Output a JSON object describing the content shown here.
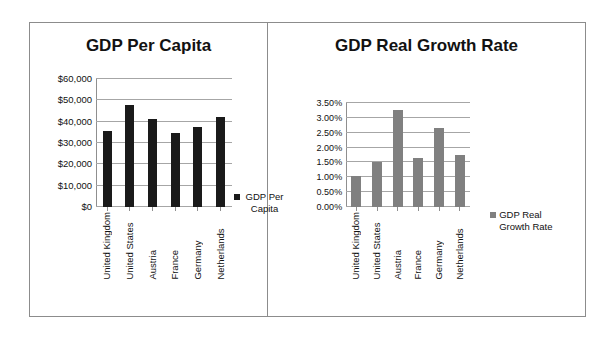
{
  "panels": [
    {
      "title": "GDP Per Capita",
      "legend_label": "GDP Per Capita",
      "legend_color": "#1a1a1a"
    },
    {
      "title": "GDP Real Growth Rate",
      "legend_label": "GDP Real Growth Rate",
      "legend_color": "#808080"
    }
  ],
  "chart_data": [
    {
      "type": "bar",
      "title": "GDP Per Capita",
      "xlabel": "",
      "ylabel": "",
      "categories": [
        "United Kingdom",
        "United States",
        "Austria",
        "France",
        "Germany",
        "Netherlands"
      ],
      "series": [
        {
          "name": "GDP Per Capita",
          "color": "#1a1a1a",
          "values": [
            35700,
            48000,
            41400,
            34800,
            37500,
            42000
          ]
        }
      ],
      "ylim": [
        0,
        60000
      ],
      "ytick_values": [
        0,
        10000,
        20000,
        30000,
        40000,
        50000,
        60000
      ],
      "ytick_labels": [
        "$0",
        "$10,000",
        "$20,000",
        "$30,000",
        "$40,000",
        "$50,000",
        "$60,000"
      ],
      "grid": true,
      "legend_position": "right"
    },
    {
      "type": "bar",
      "title": "GDP Real Growth Rate",
      "xlabel": "",
      "ylabel": "",
      "categories": [
        "United Kingdom",
        "United States",
        "Austria",
        "France",
        "Germany",
        "Netherlands"
      ],
      "series": [
        {
          "name": "GDP Real Growth Rate",
          "color": "#808080",
          "values": [
            1.05,
            1.5,
            3.25,
            1.65,
            2.65,
            1.75
          ]
        }
      ],
      "ylim": [
        0,
        3.5
      ],
      "ytick_values": [
        0,
        0.5,
        1.0,
        1.5,
        2.0,
        2.5,
        3.0,
        3.5
      ],
      "ytick_labels": [
        "0.00%",
        "0.50%",
        "1.00%",
        "1.50%",
        "2.00%",
        "2.50%",
        "3.00%",
        "3.50%"
      ],
      "grid": true,
      "legend_position": "right"
    }
  ]
}
